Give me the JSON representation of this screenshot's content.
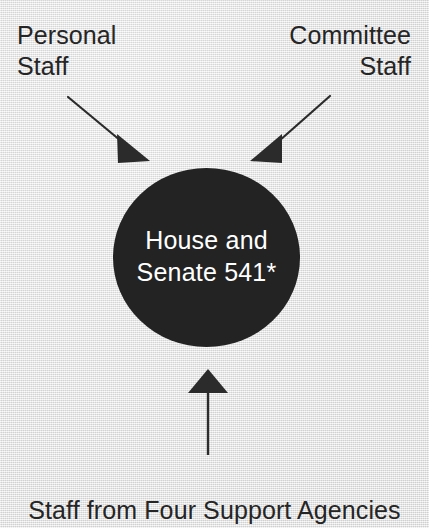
{
  "figure": {
    "type": "diagram",
    "layout": "hub-and-spoke",
    "background_color": "#e9e9e9",
    "width": 429,
    "height": 528
  },
  "central_node": {
    "label": "House and\nSenate 541*",
    "line1": "House and",
    "line2": "Senate 541*",
    "value": "541",
    "footnote_marker": "*",
    "shape": "circle",
    "fill_color": "#232323",
    "text_color": "#ffffff"
  },
  "callouts": [
    {
      "id": "personal-staff",
      "label": "Personal\nStaff",
      "align": "left",
      "arrow": "diagonal-down-right"
    },
    {
      "id": "committee-staff",
      "label": "Committee\nStaff",
      "align": "right",
      "arrow": "diagonal-down-left"
    },
    {
      "id": "support-agencies",
      "label": "Staff from Four Support Agencies",
      "align": "center",
      "arrow": "vertical-up"
    }
  ],
  "arrows": {
    "personal_staff": {
      "name": "arrow-personal-staff",
      "from": [
        68,
        97
      ],
      "to": [
        134,
        150
      ],
      "color": "#2b2b2b"
    },
    "committee_staff": {
      "name": "arrow-committee-staff",
      "from": [
        330,
        96
      ],
      "to": [
        266,
        150
      ],
      "color": "#2b2b2b"
    },
    "support_agencies": {
      "name": "arrow-support-agencies",
      "from": [
        208,
        455
      ],
      "to": [
        208,
        370
      ],
      "color": "#2b2b2b"
    }
  },
  "colors": {
    "node_fill": "#232323",
    "text_dark": "#252525",
    "text_light": "#ffffff",
    "arrow": "#2b2b2b",
    "background": "#e9e9e9"
  }
}
